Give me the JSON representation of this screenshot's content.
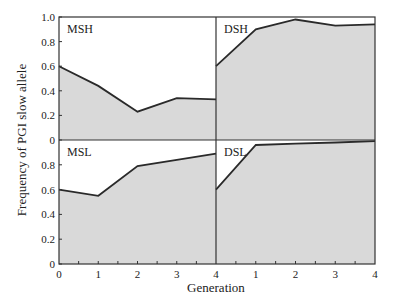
{
  "chart_data": [
    {
      "type": "area",
      "panel": "top-left",
      "label": "MSH",
      "x": [
        0,
        1,
        2,
        3,
        4
      ],
      "values": [
        0.6,
        0.44,
        0.23,
        0.34,
        0.33
      ],
      "ylim": [
        0,
        1.0
      ],
      "yticks": [
        "0",
        "0.2",
        "0.4",
        "0.6",
        "0.8",
        "1.0"
      ]
    },
    {
      "type": "area",
      "panel": "top-right",
      "label": "DSH",
      "x": [
        0,
        1,
        2,
        3,
        4
      ],
      "values": [
        0.6,
        0.9,
        0.98,
        0.93,
        0.94
      ],
      "ylim": [
        0,
        1.0
      ]
    },
    {
      "type": "area",
      "panel": "bottom-left",
      "label": "MSL",
      "x": [
        0,
        1,
        2,
        3,
        4
      ],
      "values": [
        0.6,
        0.55,
        0.79,
        0.84,
        0.89
      ],
      "ylim": [
        0,
        1.0
      ],
      "yticks": [
        "0",
        "0.2",
        "0.4",
        "0.6",
        "0.8"
      ],
      "xticks": [
        "0",
        "1",
        "2",
        "3",
        "4"
      ]
    },
    {
      "type": "area",
      "panel": "bottom-right",
      "label": "DSL",
      "x": [
        0,
        1,
        2,
        3,
        4
      ],
      "values": [
        0.6,
        0.96,
        0.97,
        0.98,
        0.99
      ],
      "ylim": [
        0,
        1.0
      ],
      "xticks": [
        "1",
        "2",
        "3",
        "4"
      ]
    }
  ],
  "axes": {
    "ylabel": "Frequency of PGI slow allele",
    "xlabel": "Generation",
    "top_yticks": [
      "0",
      "0.2",
      "0.4",
      "0.6",
      "0.8",
      "1.0"
    ],
    "bottom_yticks": [
      "0",
      "0.2",
      "0.4",
      "0.6",
      "0.8"
    ],
    "left_xticks": [
      "0",
      "1",
      "2",
      "3",
      "4"
    ],
    "right_xticks": [
      "1",
      "2",
      "3",
      "4"
    ]
  },
  "colors": {
    "fill": "#d9d9d9",
    "line": "#2a2a2a",
    "frame": "#333333"
  }
}
